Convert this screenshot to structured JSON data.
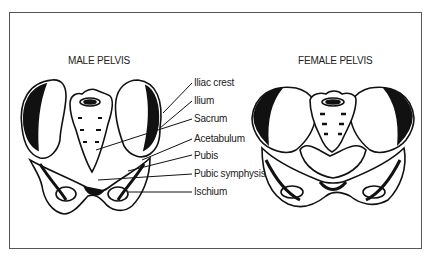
{
  "diagram": {
    "male": {
      "title": "MALE PELVIS"
    },
    "female": {
      "title": "FEMALE PELVIS"
    },
    "labels": [
      {
        "text": "Iliac crest"
      },
      {
        "text": "Ilium"
      },
      {
        "text": "Sacrum"
      },
      {
        "text": "Acetabulum"
      },
      {
        "text": "Pubis"
      },
      {
        "text": "Pubic symphysis"
      },
      {
        "text": "Ischium"
      }
    ],
    "colors": {
      "ink": "#111111",
      "frame": "#555555",
      "background": "#ffffff"
    }
  }
}
